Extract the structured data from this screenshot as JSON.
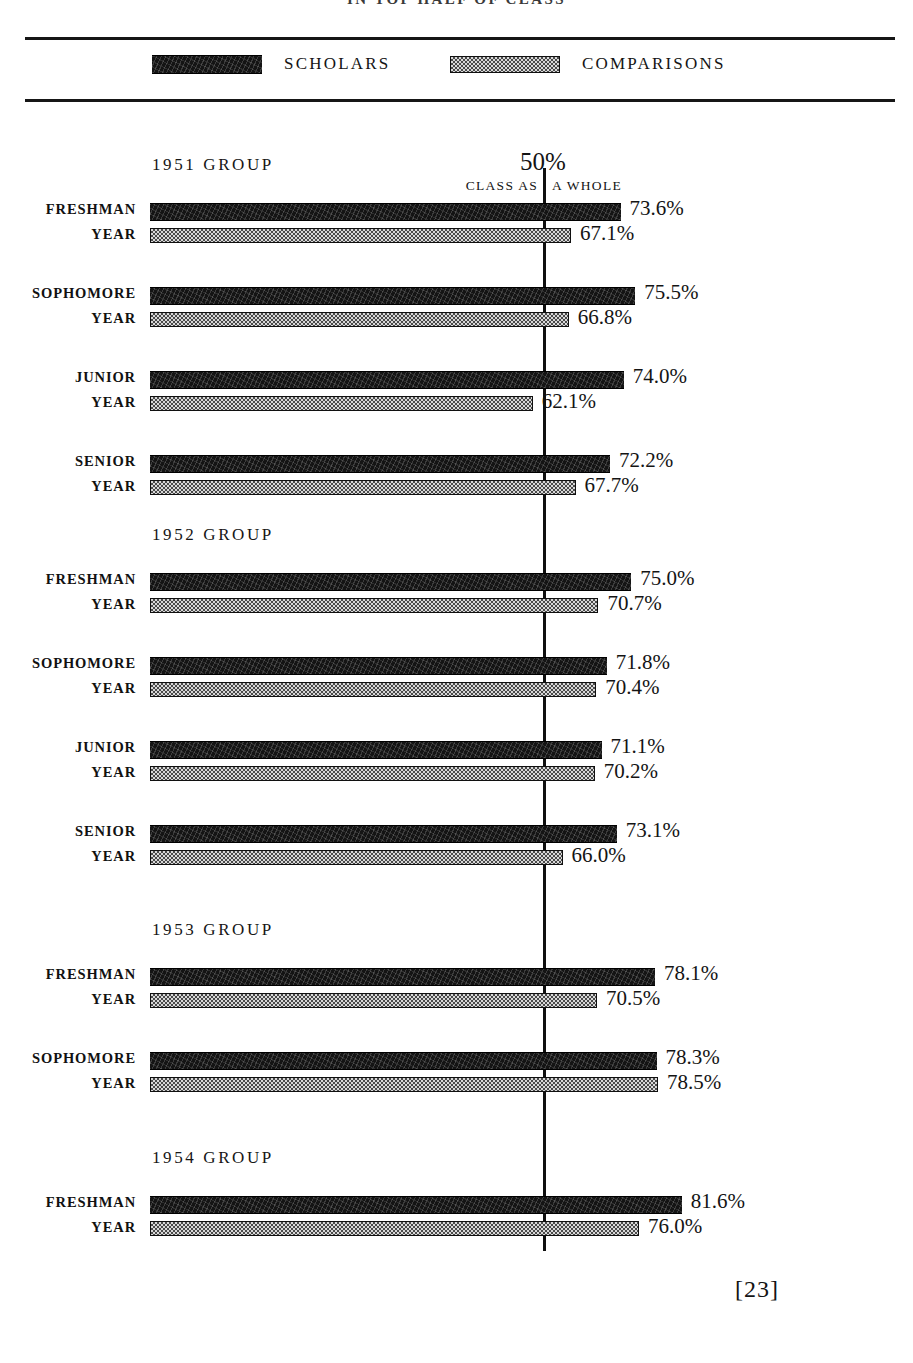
{
  "page": {
    "title": "IN TOP HALF OF CLASS",
    "page_number": "[23]"
  },
  "legend": {
    "scholars_label": "SCHOLARS",
    "comparisons_label": "COMPARISONS",
    "scholars_swatch": "scholars-swatch",
    "comparisons_swatch": "comparisons-swatch",
    "scholars_color": "#141414",
    "comparisons_color": "#c9c9c9"
  },
  "axis": {
    "midline_label": "50%",
    "midline_caption_left": "CLASS AS",
    "midline_caption_right": "A WHOLE",
    "midline_value": 50
  },
  "chart_data": {
    "type": "bar",
    "orientation": "horizontal",
    "title": "IN TOP HALF OF CLASS",
    "xlabel": "",
    "ylabel": "",
    "xlim": [
      0,
      100
    ],
    "grid": false,
    "reference_line": {
      "value": 50,
      "label": "50%",
      "caption": "CLASS AS A WHOLE"
    },
    "legend": [
      "SCHOLARS",
      "COMPARISONS"
    ],
    "legend_position": "top",
    "units": "percent",
    "groups": [
      {
        "name": "1951 GROUP",
        "rows": [
          {
            "label_line1": "FRESHMAN",
            "label_line2": "YEAR",
            "scholars": 73.6,
            "comparisons": 67.1,
            "scholars_text": "73.6%",
            "comparisons_text": "67.1%"
          },
          {
            "label_line1": "SOPHOMORE",
            "label_line2": "YEAR",
            "scholars": 75.5,
            "comparisons": 66.8,
            "scholars_text": "75.5%",
            "comparisons_text": "66.8%"
          },
          {
            "label_line1": "JUNIOR",
            "label_line2": "YEAR",
            "scholars": 74.0,
            "comparisons": 62.1,
            "scholars_text": "74.0%",
            "comparisons_text": "62.1%"
          },
          {
            "label_line1": "SENIOR",
            "label_line2": "YEAR",
            "scholars": 72.2,
            "comparisons": 67.7,
            "scholars_text": "72.2%",
            "comparisons_text": "67.7%"
          }
        ]
      },
      {
        "name": "1952 GROUP",
        "rows": [
          {
            "label_line1": "FRESHMAN",
            "label_line2": "YEAR",
            "scholars": 75.0,
            "comparisons": 70.7,
            "scholars_text": "75.0%",
            "comparisons_text": "70.7%"
          },
          {
            "label_line1": "SOPHOMORE",
            "label_line2": "YEAR",
            "scholars": 71.8,
            "comparisons": 70.4,
            "scholars_text": "71.8%",
            "comparisons_text": "70.4%"
          },
          {
            "label_line1": "JUNIOR",
            "label_line2": "YEAR",
            "scholars": 71.1,
            "comparisons": 70.2,
            "scholars_text": "71.1%",
            "comparisons_text": "70.2%"
          },
          {
            "label_line1": "SENIOR",
            "label_line2": "YEAR",
            "scholars": 73.1,
            "comparisons": 66.0,
            "scholars_text": "73.1%",
            "comparisons_text": "66.0%"
          }
        ]
      },
      {
        "name": "1953 GROUP",
        "rows": [
          {
            "label_line1": "FRESHMAN",
            "label_line2": "YEAR",
            "scholars": 78.1,
            "comparisons": 70.5,
            "scholars_text": "78.1%",
            "comparisons_text": "70.5%"
          },
          {
            "label_line1": "SOPHOMORE",
            "label_line2": "YEAR",
            "scholars": 78.3,
            "comparisons": 78.5,
            "scholars_text": "78.3%",
            "comparisons_text": "78.5%"
          }
        ]
      },
      {
        "name": "1954 GROUP",
        "rows": [
          {
            "label_line1": "FRESHMAN",
            "label_line2": "YEAR",
            "scholars": 81.6,
            "comparisons": 76.0,
            "scholars_text": "81.6%",
            "comparisons_text": "76.0%"
          }
        ]
      }
    ]
  },
  "layout": {
    "bar_origin_x": 150,
    "midline_x": 543,
    "px_per_percent": 7.64,
    "zero_value": 12.0
  }
}
